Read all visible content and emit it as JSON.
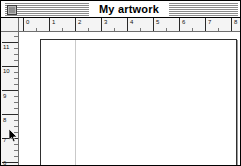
{
  "window": {
    "title": "My artwork",
    "close_box_icon": "close-box-icon",
    "border_color": "#000000",
    "titlebar_stripe_color": "#8a8a8a"
  },
  "rulers": {
    "units": "inches",
    "horizontal": {
      "labels": [
        "0",
        "1",
        "2",
        "3",
        "4",
        "5",
        "6",
        "7",
        "8"
      ],
      "label_x": [
        7,
        33,
        59,
        85,
        111,
        137,
        163,
        189,
        215
      ],
      "major_x": [
        4,
        30,
        56,
        82,
        108,
        134,
        160,
        186,
        212
      ],
      "minor_x": [
        17,
        43,
        69,
        95,
        121,
        147,
        173,
        199,
        225
      ]
    },
    "vertical": {
      "labels": [
        "11",
        "10",
        "9",
        "8",
        "7",
        "6"
      ],
      "label_y": [
        12,
        36,
        61,
        85,
        105,
        128
      ],
      "major_y": [
        10,
        34,
        58,
        82,
        106,
        130
      ],
      "minor_y": [
        4,
        16,
        22,
        28,
        40,
        46,
        52,
        64,
        70,
        76,
        88,
        94,
        100,
        112,
        118,
        124
      ]
    }
  },
  "canvas": {
    "page_label": "artboard",
    "guide_label": "vertical-guide",
    "page_background": "#ffffff",
    "page_border": "#2f2f2f",
    "guide_color": "#c9c9c9"
  },
  "cursor": {
    "type": "arrow-pointer",
    "x": 8,
    "y": 128
  }
}
